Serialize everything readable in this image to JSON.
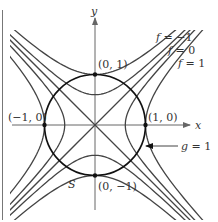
{
  "figure": {
    "axes": {
      "x_label": "x",
      "y_label": "y"
    },
    "points": [
      {
        "label": "(0, 1)",
        "x": 0,
        "y": 1
      },
      {
        "label": "(1, 0)",
        "x": 1,
        "y": 0
      },
      {
        "label": "(−1, 0)",
        "x": -1,
        "y": 0
      },
      {
        "label": "(0, −1)",
        "x": 0,
        "y": -1
      }
    ],
    "level_curve_labels": [
      {
        "text": "f = −1",
        "value": -1
      },
      {
        "text": "f = 0",
        "value": 0
      },
      {
        "text": "f = 1",
        "value": 1
      }
    ],
    "level_values": [
      -1,
      -0.36,
      0,
      0.36,
      1
    ],
    "constraint": {
      "label": "g = 1",
      "radius": 1
    },
    "set_label": "S"
  }
}
